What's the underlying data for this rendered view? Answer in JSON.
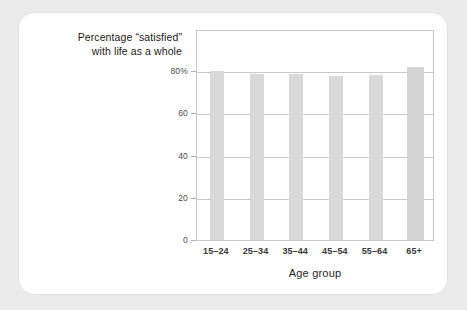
{
  "card": {
    "background_color": "#ffffff",
    "page_background_color": "#ebebec"
  },
  "caption": {
    "line1": "Percentage “satisfied”",
    "line2": "with life as a whole"
  },
  "chart_data": {
    "type": "bar",
    "title": "Percentage “satisfied” with life as a whole",
    "xlabel": "Age group",
    "ylabel": "",
    "categories": [
      "15–24",
      "25–34",
      "35–44",
      "45–54",
      "55–64",
      "65+"
    ],
    "values": [
      80,
      78.5,
      78.5,
      77.5,
      78,
      82
    ],
    "ylim": [
      0,
      100
    ],
    "yticks": [
      0,
      20,
      40,
      60,
      80
    ],
    "ytick_labels": [
      "0",
      "20",
      "40",
      "60",
      "80%"
    ],
    "grid": true,
    "legend": false,
    "bar_color": "#d9d9d9",
    "gridline_color": "#c9c9c9",
    "frame_color": "#c9c9c9"
  }
}
